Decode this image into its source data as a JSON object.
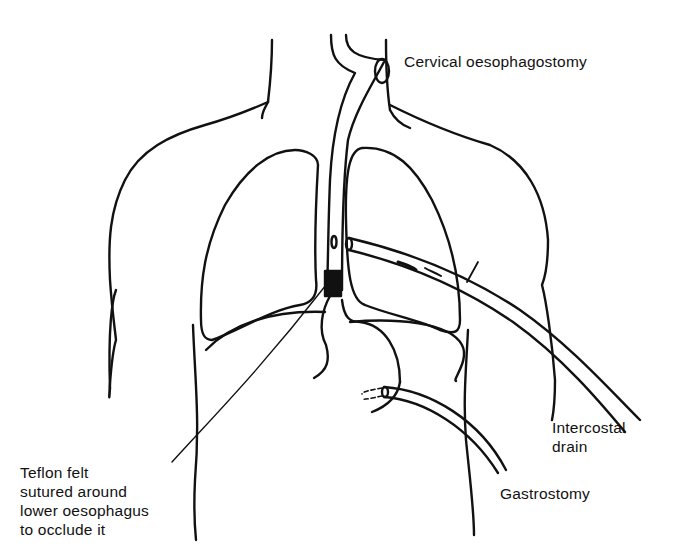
{
  "figure": {
    "type": "anatomical line diagram",
    "stroke_color": "#111111",
    "background_color": "#ffffff"
  },
  "labels": {
    "cervical": {
      "text": "Cervical oesophagostomy"
    },
    "teflon": {
      "lines": [
        "Teflon felt",
        "sutured around",
        "lower oesophagus",
        "to occlude it"
      ]
    },
    "intercostal": {
      "lines": [
        "Intercostal",
        "drain"
      ]
    },
    "gastrostomy": {
      "text": "Gastrostomy"
    }
  }
}
